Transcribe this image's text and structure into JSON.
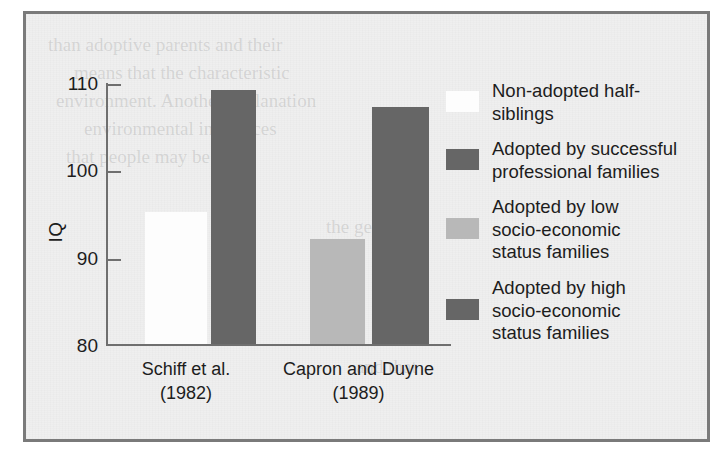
{
  "chart_data": {
    "type": "bar",
    "title": "",
    "xlabel": "",
    "ylabel": "IQ",
    "ylim": [
      80,
      110
    ],
    "yticks": [
      80,
      90,
      100,
      110
    ],
    "ytick_labels": [
      "80",
      "90",
      "100",
      "110"
    ],
    "grid": false,
    "legend_position": "right",
    "categories": [
      "Schiff et al.\n(1982)",
      "Capron and Duyne\n(1989)"
    ],
    "category_lines": [
      [
        "Schiff et al.",
        "(1982)"
      ],
      [
        "Capron and Duyne",
        "(1989)"
      ]
    ],
    "series": [
      {
        "name": "Non-adopted half-siblings",
        "color": "#fdfdfd",
        "values": [
          95,
          null
        ]
      },
      {
        "name": "Adopted by successful professional families",
        "color": "#666666",
        "values": [
          109,
          null
        ]
      },
      {
        "name": "Adopted by low socio-economic status families",
        "color": "#b8b8b8",
        "values": [
          null,
          92
        ]
      },
      {
        "name": "Adopted by high socio-economic status families",
        "color": "#666666",
        "values": [
          null,
          107
        ]
      }
    ],
    "bars": [
      {
        "group": 0,
        "series": 0,
        "value": 95,
        "color_key": "white",
        "x": 39,
        "width": 62
      },
      {
        "group": 0,
        "series": 1,
        "value": 109,
        "color_key": "dark",
        "x": 105,
        "width": 45
      },
      {
        "group": 1,
        "series": 2,
        "value": 92,
        "color_key": "light",
        "x": 204,
        "width": 55
      },
      {
        "group": 1,
        "series": 3,
        "value": 107,
        "color_key": "dark",
        "x": 266,
        "width": 57
      }
    ],
    "legend_entries": [
      {
        "color_key": "white",
        "lines": [
          "Non-adopted half-",
          "siblings"
        ]
      },
      {
        "color_key": "dark",
        "lines": [
          "Adopted by successful",
          "professional families"
        ]
      },
      {
        "color_key": "light",
        "lines": [
          "Adopted by low",
          "socio-economic",
          "status families"
        ]
      },
      {
        "color_key": "dark",
        "lines": [
          "Adopted by high",
          "socio-economic",
          "status families"
        ]
      }
    ]
  },
  "colors": {
    "frame_border": "#7a7a7a",
    "plot_background": "#efefef",
    "axis": "#6f6f6f",
    "bar_white": "#fdfdfd",
    "bar_dark": "#666666",
    "bar_light": "#b8b8b8",
    "text": "#1d1d1d"
  },
  "bleed_text": {
    "lines": [
      "than adoptive parents and their",
      "means that the characteristic",
      "environment. Another explanation",
      "environmental influences",
      "that people may be",
      "the genetic",
      "and that"
    ]
  }
}
